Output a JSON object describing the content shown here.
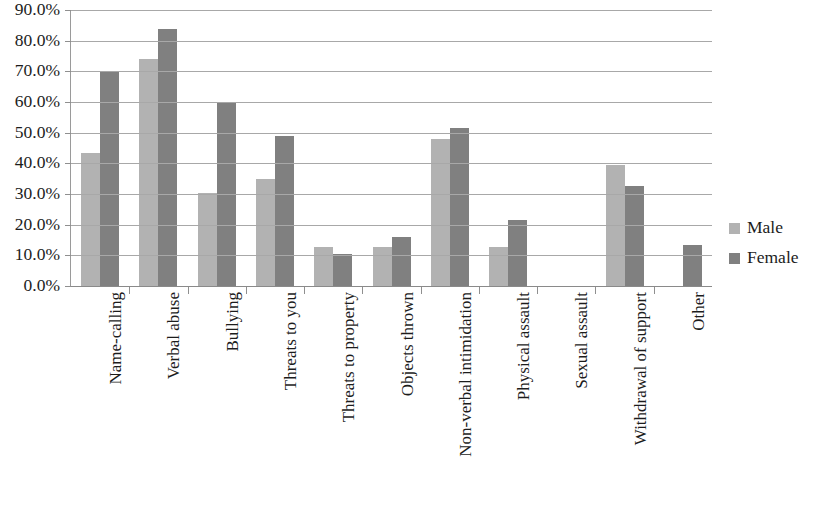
{
  "chart_data": {
    "type": "bar",
    "title": "",
    "subtitle": "",
    "xlabel": "",
    "ylabel": "",
    "ylim": [
      0,
      90
    ],
    "y_tick_labels": [
      "90.0%",
      "80.0%",
      "70.0%",
      "60.0%",
      "50.0%",
      "40.0%",
      "30.0%",
      "20.0%",
      "10.0%",
      "0.0%"
    ],
    "y_tick_values": [
      90,
      80,
      70,
      60,
      50,
      40,
      30,
      20,
      10,
      0
    ],
    "grid": true,
    "legend_position": "right",
    "categories": [
      "Name-calling",
      "Verbal abuse",
      "Bullying",
      "Threats to you",
      "Threats to property",
      "Objects thrown",
      "Non-verbal intimidation",
      "Physical assault",
      "Sexual assault",
      "Withdrawal of support",
      "Other"
    ],
    "series": [
      {
        "name": "Male",
        "color": "#b2b2b2",
        "values": [
          43.5,
          74.0,
          30.3,
          34.8,
          12.8,
          12.8,
          47.8,
          12.8,
          0.0,
          39.5,
          0.0
        ]
      },
      {
        "name": "Female",
        "color": "#808080",
        "values": [
          70.2,
          83.9,
          59.6,
          48.8,
          10.6,
          16.0,
          51.5,
          21.5,
          0.0,
          32.5,
          13.5
        ]
      }
    ]
  },
  "legend": {
    "items": [
      {
        "label": "Male",
        "color": "#b2b2b2"
      },
      {
        "label": "Female",
        "color": "#808080"
      }
    ]
  },
  "colors": {
    "male": "#b2b2b2",
    "female": "#808080",
    "gridline": "#a8a8a8",
    "axis": "#8f8f8f",
    "text": "#1c1c1c",
    "background": "#ffffff"
  }
}
